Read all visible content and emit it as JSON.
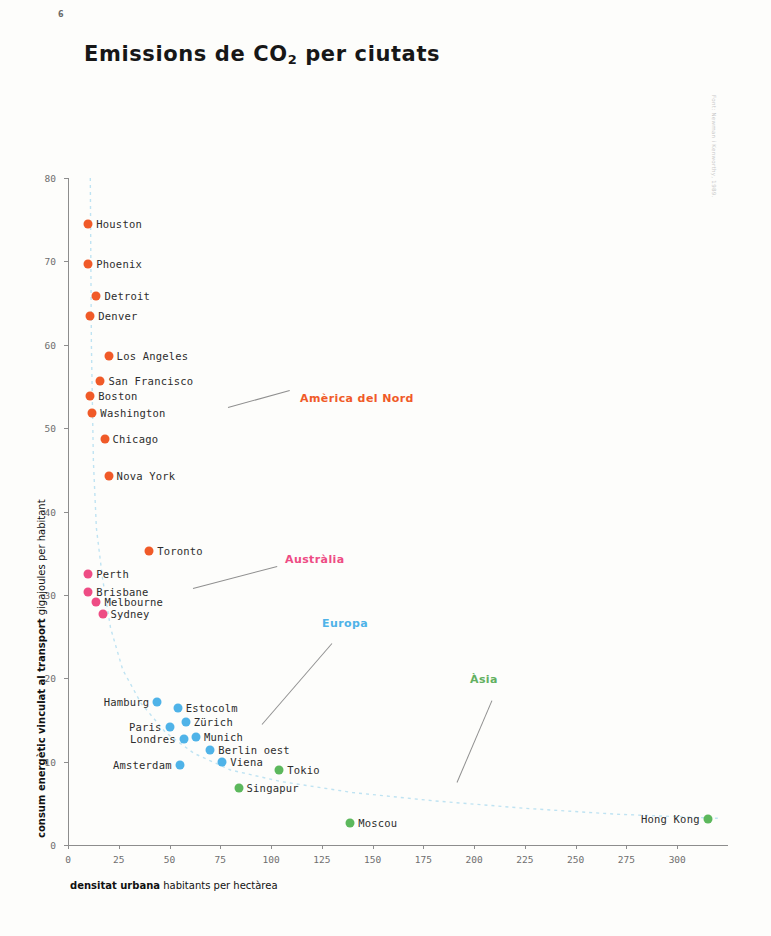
{
  "page": {
    "number": "6",
    "credit": "Font: Newman i Kenworthy, 1989."
  },
  "header": {
    "title_main": "Emissions de CO",
    "title_sub": "2",
    "title_tail": " per ciutats"
  },
  "axes": {
    "x_title_bold": "densitat urbana",
    "x_title_rest": " habitants per hectàrea",
    "y_title_bold": "consum energètic vinculat al transport",
    "y_title_rest": " gigajoules per habitant"
  },
  "chart_data": {
    "type": "scatter",
    "title": "Emissions de CO2 per ciutats",
    "xlabel": "densitat urbana habitants per hectàrea",
    "ylabel": "consum energètic vinculat al transport gigajoules per habitant",
    "xlim": [
      0,
      325
    ],
    "ylim": [
      0,
      80
    ],
    "xticks": [
      0,
      25,
      50,
      75,
      100,
      125,
      150,
      175,
      200,
      225,
      250,
      275,
      300
    ],
    "yticks": [
      0,
      10,
      20,
      30,
      40,
      50,
      60,
      70,
      80
    ],
    "grid": false,
    "legend_position": "inline-annotations",
    "trend": {
      "style": "dashed",
      "color": "#bfe3f2",
      "points": [
        [
          11,
          80
        ],
        [
          11.5,
          60
        ],
        [
          12.5,
          46
        ],
        [
          14,
          38
        ],
        [
          17,
          32
        ],
        [
          21,
          26
        ],
        [
          27,
          21
        ],
        [
          36,
          17
        ],
        [
          48,
          13.5
        ],
        [
          62,
          11
        ],
        [
          80,
          9
        ],
        [
          105,
          7.6
        ],
        [
          140,
          6.3
        ],
        [
          180,
          5.3
        ],
        [
          225,
          4.4
        ],
        [
          270,
          3.7
        ],
        [
          320,
          3.2
        ]
      ]
    },
    "series": [
      {
        "name": "Amèrica del Nord",
        "color": "#F05A28",
        "label_color": "#F05A28",
        "points": [
          {
            "city": "Houston",
            "x": 10,
            "y": 74.5,
            "label_side": "right"
          },
          {
            "city": "Phoenix",
            "x": 10,
            "y": 69.7,
            "label_side": "right"
          },
          {
            "city": "Detroit",
            "x": 14,
            "y": 65.8,
            "label_side": "right"
          },
          {
            "city": "Denver",
            "x": 11,
            "y": 63.4,
            "label_side": "right"
          },
          {
            "city": "Los Angeles",
            "x": 20,
            "y": 58.6,
            "label_side": "right"
          },
          {
            "city": "San Francisco",
            "x": 16,
            "y": 55.6,
            "label_side": "right"
          },
          {
            "city": "Boston",
            "x": 11,
            "y": 53.8,
            "label_side": "right"
          },
          {
            "city": "Washington",
            "x": 12,
            "y": 51.8,
            "label_side": "right"
          },
          {
            "city": "Chicago",
            "x": 18,
            "y": 48.7,
            "label_side": "right"
          },
          {
            "city": "Nova York",
            "x": 20,
            "y": 44.3,
            "label_side": "right"
          },
          {
            "city": "Toronto",
            "x": 40,
            "y": 35.3,
            "label_side": "right"
          }
        ]
      },
      {
        "name": "Austràlia",
        "color": "#EE4C84",
        "label_color": "#EE4C84",
        "points": [
          {
            "city": "Perth",
            "x": 10,
            "y": 32.5,
            "label_side": "right"
          },
          {
            "city": "Brisbane",
            "x": 10,
            "y": 30.4,
            "label_side": "right"
          },
          {
            "city": "Melbourne",
            "x": 14,
            "y": 29.2,
            "label_side": "right"
          },
          {
            "city": "Sydney",
            "x": 17,
            "y": 27.7,
            "label_side": "right"
          }
        ]
      },
      {
        "name": "Europa",
        "color": "#4FB3E8",
        "label_color": "#4FB3E8",
        "points": [
          {
            "city": "Hamburg",
            "x": 44,
            "y": 17.1,
            "label_side": "left"
          },
          {
            "city": "Estocolm",
            "x": 54,
            "y": 16.4,
            "label_side": "right"
          },
          {
            "city": "Zürich",
            "x": 58,
            "y": 14.8,
            "label_side": "right"
          },
          {
            "city": "Paris",
            "x": 50,
            "y": 14.1,
            "label_side": "left"
          },
          {
            "city": "Munich",
            "x": 63,
            "y": 13.0,
            "label_side": "right"
          },
          {
            "city": "Londres",
            "x": 57,
            "y": 12.7,
            "label_side": "left"
          },
          {
            "city": "Berlin oest",
            "x": 70,
            "y": 11.4,
            "label_side": "right"
          },
          {
            "city": "Viena",
            "x": 76,
            "y": 10.0,
            "label_side": "right"
          },
          {
            "city": "Amsterdam",
            "x": 55,
            "y": 9.6,
            "label_side": "left"
          }
        ]
      },
      {
        "name": "Àsia",
        "color": "#5CB85C",
        "label_color": "#62B060",
        "points": [
          {
            "city": "Tokio",
            "x": 104,
            "y": 9.0,
            "label_side": "right"
          },
          {
            "city": "Singapur",
            "x": 84,
            "y": 6.8,
            "label_side": "right"
          },
          {
            "city": "Moscou",
            "x": 139,
            "y": 2.6,
            "label_side": "right"
          },
          {
            "city": "Hong Kong",
            "x": 315,
            "y": 3.1,
            "label_side": "left"
          }
        ]
      }
    ],
    "annotations": [
      {
        "text": "Amèrica del Nord",
        "color": "#F05A28",
        "x": 300,
        "y": 398,
        "leader": {
          "x1": 228,
          "y1": 407,
          "x2": 290,
          "y2": 390
        }
      },
      {
        "text": "Austràlia",
        "color": "#EE4C84",
        "x": 285,
        "y": 559,
        "leader": {
          "x1": 193,
          "y1": 588,
          "x2": 277,
          "y2": 566
        }
      },
      {
        "text": "Europa",
        "color": "#4FB3E8",
        "x": 322,
        "y": 623,
        "leader": {
          "x1": 262,
          "y1": 724,
          "x2": 332,
          "y2": 643
        }
      },
      {
        "text": "Àsia",
        "color": "#62B060",
        "x": 470,
        "y": 679,
        "leader": {
          "x1": 457,
          "y1": 782,
          "x2": 492,
          "y2": 700
        }
      }
    ]
  }
}
